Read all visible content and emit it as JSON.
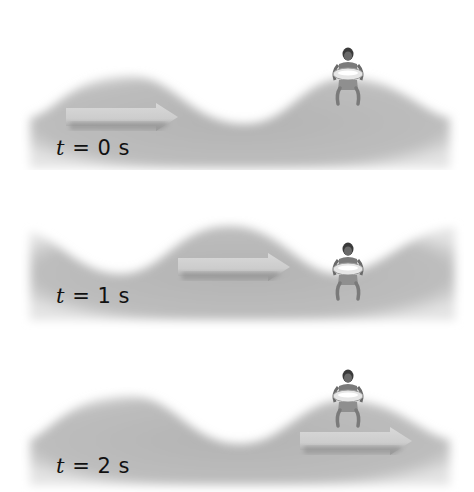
{
  "figure": {
    "colors": {
      "water": "#b7b7b7",
      "water_edge": "#d8d8d8",
      "arrow": "#d2d2d2",
      "arrow_shadow": "#8c8c8c",
      "background": "#ffffff"
    },
    "panels": [
      {
        "time_var": "t",
        "eq": " = ",
        "value": "0 s",
        "label": "t = 0 s",
        "person_position": "crest",
        "arrow_direction": "right"
      },
      {
        "time_var": "t",
        "eq": " = ",
        "value": "1 s",
        "label": "t = 1 s",
        "person_position": "trough",
        "arrow_direction": "right"
      },
      {
        "time_var": "t",
        "eq": " = ",
        "value": "2 s",
        "label": "t = 2 s",
        "person_position": "crest",
        "arrow_direction": "right"
      }
    ]
  }
}
